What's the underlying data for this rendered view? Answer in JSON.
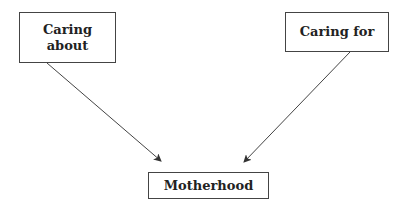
{
  "diagram": {
    "nodes": [
      {
        "id": "caring-about",
        "label_line1": "Caring",
        "label_line2": "about"
      },
      {
        "id": "caring-for",
        "label": "Caring for"
      },
      {
        "id": "motherhood",
        "label": "Motherhood"
      }
    ],
    "edges": [
      {
        "from": "caring-about",
        "to": "motherhood"
      },
      {
        "from": "caring-for",
        "to": "motherhood"
      }
    ],
    "colors": {
      "stroke": "#444444",
      "text": "#222222",
      "background": "#ffffff"
    }
  }
}
